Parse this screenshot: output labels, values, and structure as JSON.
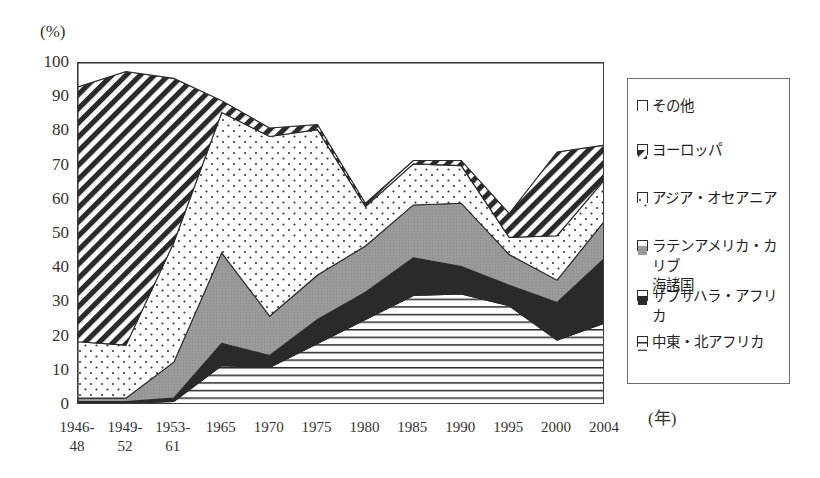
{
  "axis": {
    "y_unit": "(%)",
    "x_unit": "(年)",
    "y_ticks": [
      "100",
      "90",
      "80",
      "70",
      "60",
      "50",
      "40",
      "30",
      "20",
      "10",
      "0"
    ],
    "x_ticks": [
      "1946-\n48",
      "1949-\n52",
      "1953-\n61",
      "1965",
      "1970",
      "1975",
      "1980",
      "1985",
      "1990",
      "1995",
      "2000",
      "2004"
    ]
  },
  "legend": {
    "items": [
      {
        "label": "その他",
        "pattern": "blank",
        "swatch": "white"
      },
      {
        "label": "ヨーロッパ",
        "pattern": "diagonal-stripe",
        "swatch": "diagonal"
      },
      {
        "label": "アジア・オセアニア",
        "pattern": "dotted",
        "swatch": "dots"
      },
      {
        "label": "ラテンアメリカ・カリブ\n海諸国",
        "pattern": "solid-gray",
        "swatch": "gray"
      },
      {
        "label": "サブサハラ・アフリカ",
        "pattern": "solid-black",
        "swatch": "black"
      },
      {
        "label": "中東・北アフリカ",
        "pattern": "horizontal-line",
        "swatch": "horizontal"
      }
    ]
  },
  "chart_data": {
    "type": "area",
    "title": "",
    "xlabel": "(年)",
    "ylabel": "(%)",
    "ylim": [
      0,
      100
    ],
    "grid": false,
    "stacked": true,
    "legend_position": "right",
    "categories": [
      "1946-48",
      "1949-52",
      "1953-61",
      "1965",
      "1970",
      "1975",
      "1980",
      "1985",
      "1990",
      "1995",
      "2000",
      "2004"
    ],
    "series": [
      {
        "name": "中東・北アフリカ",
        "pattern": "horizontal-line",
        "values": [
          0.5,
          0.5,
          1.0,
          11.5,
          11.0,
          18.0,
          25.0,
          32.0,
          32.5,
          29.0,
          19.0,
          24.0
        ]
      },
      {
        "name": "サブサハラ・アフリカ",
        "pattern": "solid-black",
        "values": [
          0.5,
          0.5,
          1.0,
          6.5,
          3.5,
          7.0,
          8.0,
          11.0,
          8.0,
          6.0,
          11.0,
          19.0
        ]
      },
      {
        "name": "ラテンアメリカ・カリブ海諸国",
        "pattern": "solid-gray",
        "values": [
          1.0,
          1.0,
          10.5,
          26.5,
          11.5,
          13.0,
          13.5,
          15.5,
          18.5,
          9.0,
          6.5,
          11.0
        ]
      },
      {
        "name": "アジア・オセアニア",
        "pattern": "dotted",
        "values": [
          16.5,
          15.5,
          35.0,
          41.0,
          52.5,
          42.5,
          11.5,
          12.0,
          11.0,
          5.0,
          13.0,
          12.0
        ]
      },
      {
        "name": "ヨーロッパ",
        "pattern": "diagonal-stripe",
        "values": [
          74.5,
          80.0,
          48.0,
          3.5,
          2.5,
          1.5,
          1.0,
          1.0,
          1.5,
          7.0,
          24.5,
          10.0
        ]
      },
      {
        "name": "その他",
        "pattern": "blank",
        "values": [
          7.0,
          2.5,
          4.5,
          11.0,
          19.0,
          18.0,
          41.0,
          28.5,
          28.5,
          44.0,
          26.0,
          24.0
        ]
      }
    ],
    "cumulative_tops": {
      "中東・北アフリカ": [
        0.5,
        0.5,
        1.0,
        11.5,
        11.0,
        18.0,
        25.0,
        32.0,
        32.5,
        29.0,
        19.0,
        24.0
      ],
      "サブサハラ・アフリカ": [
        1.0,
        1.0,
        2.0,
        18.0,
        14.5,
        25.0,
        33.0,
        43.0,
        40.5,
        35.0,
        30.0,
        43.0
      ],
      "ラテンアメリカ・カリブ海諸国": [
        2.0,
        2.0,
        12.5,
        44.5,
        26.0,
        38.0,
        46.5,
        58.5,
        59.0,
        44.0,
        36.5,
        54.0
      ],
      "アジア・オセアニア": [
        18.5,
        17.5,
        47.5,
        85.5,
        78.5,
        80.5,
        58.0,
        70.5,
        70.0,
        49.0,
        49.5,
        66.0
      ],
      "ヨーロッパ": [
        93.0,
        97.5,
        95.5,
        89.0,
        81.0,
        82.0,
        59.0,
        71.5,
        71.5,
        56.0,
        74.0,
        76.0
      ],
      "その他": [
        100,
        100,
        100,
        100,
        100,
        100,
        100,
        100,
        100,
        100,
        100,
        100
      ]
    }
  }
}
